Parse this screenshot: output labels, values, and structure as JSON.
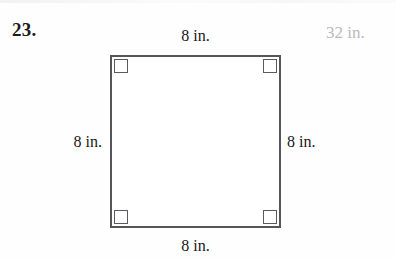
{
  "problem": {
    "number": "23.",
    "answer": "32 in."
  },
  "figure": {
    "shape_name": "square",
    "labels": {
      "top": "8 in.",
      "right": "8 in.",
      "bottom": "8 in.",
      "left": "8 in."
    },
    "right_angle_marks": 4
  },
  "colors": {
    "page_background": "#fefefe",
    "shape_stroke": "#55565a",
    "shape_fill": "#ffffff",
    "label_text": "#171717",
    "number_text": "#1b1b1b",
    "answer_text": "#b9b9bb"
  }
}
